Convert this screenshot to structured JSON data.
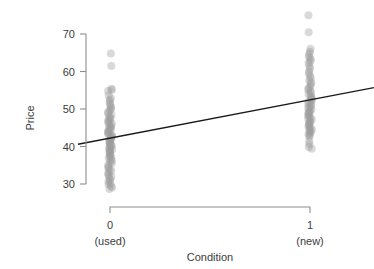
{
  "chart_data": {
    "type": "scatter",
    "title": "",
    "xlabel": "Condition",
    "ylabel": "Price",
    "xlim": [
      -0.16,
      1.32
    ],
    "ylim": [
      27.0,
      72.5
    ],
    "grid": false,
    "legend": null,
    "x_tick_values": [
      0,
      1
    ],
    "x_tick_labels": [
      "0",
      "1"
    ],
    "x_tick_sublabels": [
      "(used)",
      "(new)"
    ],
    "y_tick_values": [
      30,
      40,
      50,
      60,
      70
    ],
    "y_tick_labels": [
      "30",
      "40",
      "50",
      "60",
      "70"
    ],
    "point_color": "#9a9a9a",
    "point_opacity": 0.38,
    "point_radius": 4.0,
    "line_color": "#1a1a1a",
    "axis_color": "#8d8d8d",
    "fit_line": {
      "label": "least-squares fit",
      "x_start": -0.16,
      "y_start": 40.6,
      "x_end": 1.32,
      "y_end": 55.7,
      "intercept": 42.2,
      "slope": 10.2
    },
    "series": [
      {
        "name": "used",
        "x": 0,
        "values": [
          64.8,
          61.5,
          55.4,
          55.1,
          54.8,
          53.6,
          52.9,
          52.4,
          51.9,
          51.4,
          50.9,
          50.4,
          50.0,
          49.6,
          49.2,
          48.8,
          48.4,
          48.0,
          47.6,
          47.3,
          47.0,
          46.7,
          46.4,
          46.1,
          45.8,
          45.5,
          45.2,
          44.9,
          44.6,
          44.3,
          44.0,
          43.8,
          43.5,
          43.2,
          43.0,
          42.7,
          42.5,
          42.2,
          42.0,
          41.7,
          41.5,
          41.2,
          41.0,
          40.7,
          40.5,
          40.2,
          40.0,
          39.7,
          39.5,
          39.2,
          39.0,
          38.7,
          38.4,
          38.1,
          37.8,
          37.5,
          37.2,
          36.9,
          36.6,
          36.2,
          35.9,
          35.5,
          35.1,
          34.7,
          34.3,
          33.9,
          33.5,
          33.1,
          32.7,
          32.3,
          31.9,
          31.5,
          31.1,
          30.7,
          30.3,
          29.9,
          29.5,
          29.1,
          28.7
        ]
      },
      {
        "name": "new",
        "x": 1,
        "values": [
          75.0,
          70.5,
          66.1,
          65.3,
          64.7,
          64.1,
          63.6,
          63.1,
          62.6,
          62.1,
          61.4,
          60.7,
          60.0,
          59.4,
          58.8,
          58.2,
          57.6,
          57.1,
          56.6,
          56.1,
          55.6,
          55.2,
          54.8,
          54.4,
          54.0,
          53.6,
          53.2,
          52.9,
          52.6,
          52.3,
          52.0,
          51.7,
          51.4,
          51.1,
          50.8,
          50.5,
          50.2,
          49.9,
          49.6,
          49.3,
          49.0,
          48.7,
          48.4,
          48.1,
          47.8,
          47.5,
          47.2,
          46.9,
          46.6,
          46.3,
          46.0,
          45.7,
          45.4,
          45.1,
          44.8,
          44.5,
          44.2,
          43.9,
          43.6,
          43.3,
          43.0,
          42.6,
          41.4,
          40.6,
          39.9,
          39.4
        ]
      }
    ]
  }
}
